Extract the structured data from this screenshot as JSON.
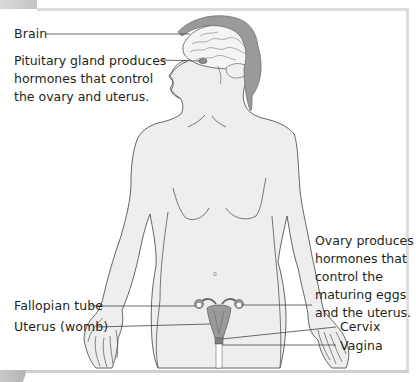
{
  "figure": {
    "colors": {
      "skin": "#eeeeee",
      "outline": "#555555",
      "organ": "#9a9a9a",
      "organ_dark": "#7f7f7f",
      "leader_line": "#444444",
      "text": "#231f20",
      "frame": "#dcdcdc"
    }
  },
  "labels": {
    "brain": "Brain",
    "pituitary": {
      "lines": [
        "Pituitary gland produces",
        "hormones that control",
        "the ovary and uterus."
      ]
    },
    "ovary": {
      "lines": [
        "Ovary produces",
        "hormones that",
        "control the",
        "maturing eggs",
        "and the uterus."
      ]
    },
    "fallopian_tube": "Fallopian tube",
    "uterus": "Uterus (womb)",
    "cervix": "Cervix",
    "vagina": "Vagina"
  }
}
